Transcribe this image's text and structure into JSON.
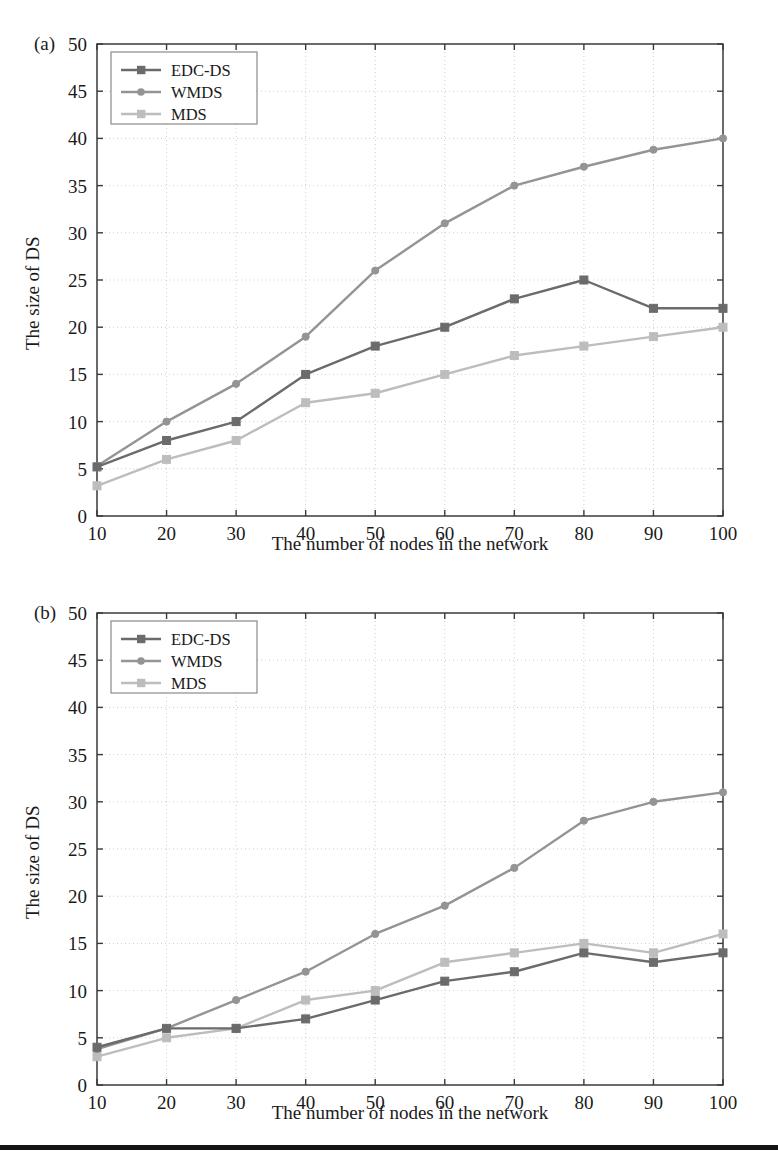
{
  "figure": {
    "background": "#ffffff",
    "footer_bar_color": "#141414"
  },
  "panels": [
    {
      "tag": "(a)",
      "legend_items": [
        "EDC-DS",
        "WMDS",
        "MDS"
      ]
    },
    {
      "tag": "(b)",
      "legend_items": [
        "EDC-DS",
        "WMDS",
        "MDS"
      ]
    }
  ],
  "axis_text": {
    "xlabel": "The number of nodes in the network",
    "ylabel": "The size of DS",
    "xticks": [
      "10",
      "20",
      "30",
      "40",
      "50",
      "60",
      "70",
      "80",
      "90",
      "100"
    ],
    "yticks": [
      "0",
      "5",
      "10",
      "15",
      "20",
      "25",
      "30",
      "35",
      "40",
      "45",
      "50"
    ]
  },
  "colors": {
    "edcds": "#6b6b6b",
    "wmds": "#949494",
    "mds": "#bdbdbd",
    "axis": "#3a3a3a",
    "grid": "#c9c9c9",
    "legend_border": "#8a8a8a"
  },
  "chart_data": [
    {
      "type": "line",
      "title": "(a)",
      "xlabel": "The number of nodes in the network",
      "ylabel": "The size of DS",
      "xlim": [
        10,
        100
      ],
      "ylim": [
        0,
        50
      ],
      "xticks": [
        10,
        20,
        30,
        40,
        50,
        60,
        70,
        80,
        90,
        100
      ],
      "yticks": [
        0,
        5,
        10,
        15,
        20,
        25,
        30,
        35,
        40,
        45,
        50
      ],
      "grid": true,
      "legend_position": "upper left",
      "x": [
        10,
        20,
        30,
        40,
        50,
        60,
        70,
        80,
        90,
        100
      ],
      "series": [
        {
          "name": "EDC-DS",
          "marker": "square",
          "color": "#6b6b6b",
          "values": [
            5.2,
            8,
            10,
            15,
            18,
            20,
            23,
            25,
            22,
            22
          ]
        },
        {
          "name": "WMDS",
          "marker": "circle",
          "color": "#949494",
          "values": [
            5.3,
            10,
            14,
            19,
            26,
            31,
            35,
            37,
            38.8,
            40
          ]
        },
        {
          "name": "MDS",
          "marker": "square",
          "color": "#bdbdbd",
          "values": [
            3.2,
            6,
            8,
            12,
            13,
            15,
            17,
            18,
            19,
            20
          ]
        }
      ]
    },
    {
      "type": "line",
      "title": "(b)",
      "xlabel": "The number of nodes in the network",
      "ylabel": "The size of DS",
      "xlim": [
        10,
        100
      ],
      "ylim": [
        0,
        50
      ],
      "xticks": [
        10,
        20,
        30,
        40,
        50,
        60,
        70,
        80,
        90,
        100
      ],
      "yticks": [
        0,
        5,
        10,
        15,
        20,
        25,
        30,
        35,
        40,
        45,
        50
      ],
      "grid": true,
      "legend_position": "upper left",
      "x": [
        10,
        20,
        30,
        40,
        50,
        60,
        70,
        80,
        90,
        100
      ],
      "series": [
        {
          "name": "EDC-DS",
          "marker": "square",
          "color": "#6b6b6b",
          "values": [
            4,
            6,
            6,
            7,
            9,
            11,
            12,
            14,
            13,
            14
          ]
        },
        {
          "name": "WMDS",
          "marker": "circle",
          "color": "#949494",
          "values": [
            3.8,
            6,
            9,
            12,
            16,
            19,
            23,
            28,
            30,
            31
          ]
        },
        {
          "name": "MDS",
          "marker": "square",
          "color": "#bdbdbd",
          "values": [
            3,
            5,
            6,
            9,
            10,
            13,
            14,
            15,
            14,
            16
          ]
        }
      ]
    }
  ]
}
